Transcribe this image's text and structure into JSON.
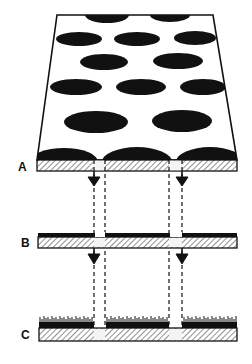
{
  "diagram": {
    "type": "layer-transfer schematic",
    "labels": {
      "a": "A",
      "b": "B",
      "c": "C"
    },
    "layers": [
      {
        "id": "A",
        "description": "perforated sheet seen in perspective with elliptical dark spots, ending in hatched strip"
      },
      {
        "id": "B",
        "description": "hatched strip with black top band, two gaps"
      },
      {
        "id": "C",
        "description": "hatched base strip with grass-like fringe, two gaps"
      }
    ],
    "connections": [
      {
        "from": "A",
        "to": "B",
        "count": 2,
        "style": "dashed channel with downward arrow"
      },
      {
        "from": "B",
        "to": "C",
        "count": 2,
        "style": "dashed channel with downward arrow"
      }
    ],
    "colors": {
      "ink": "#111111",
      "background": "#ffffff",
      "hatch": "#555555"
    }
  }
}
